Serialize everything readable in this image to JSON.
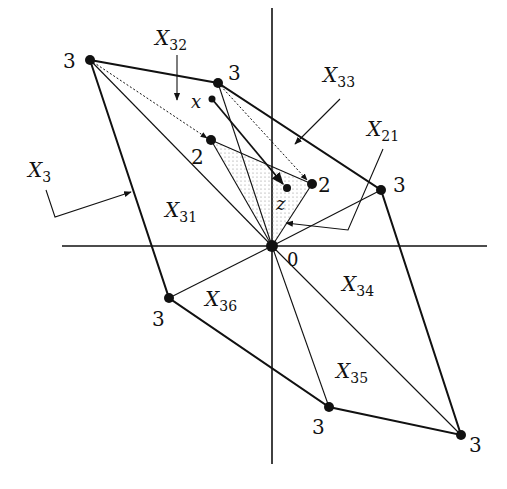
{
  "diagram": {
    "colors": {
      "ink": "#111111",
      "shade": "#bdbdbd",
      "background": "#ffffff"
    },
    "origin_label": "0",
    "vertex_labels": {
      "top_left": "3",
      "top": "3",
      "right": "3",
      "bottom_right": "3",
      "bottom": "3",
      "left": "3",
      "mid_left": "2",
      "mid_right": "2"
    },
    "point_labels": {
      "x": "x",
      "z": "z"
    },
    "region_labels": {
      "X3": {
        "base": "X",
        "sub": "3"
      },
      "X31": {
        "base": "X",
        "sub": "31"
      },
      "X32": {
        "base": "X",
        "sub": "32"
      },
      "X33": {
        "base": "X",
        "sub": "33"
      },
      "X34": {
        "base": "X",
        "sub": "34"
      },
      "X35": {
        "base": "X",
        "sub": "35"
      },
      "X36": {
        "base": "X",
        "sub": "36"
      },
      "X21": {
        "base": "X",
        "sub": "21"
      }
    }
  }
}
